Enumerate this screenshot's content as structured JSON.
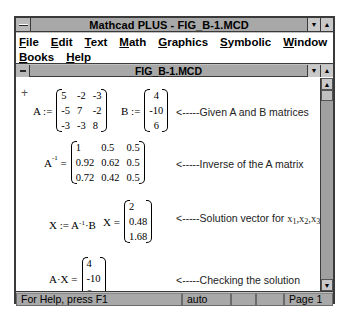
{
  "app": {
    "title": "Mathcad PLUS - FIG_B-1.MCD",
    "controls": {
      "minimize": "▼",
      "maximize": "▲"
    }
  },
  "menubar": {
    "row1": [
      {
        "key": "F",
        "rest": "ile",
        "label": "File"
      },
      {
        "key": "E",
        "rest": "dit",
        "label": "Edit"
      },
      {
        "key": "T",
        "rest": "ext",
        "label": "Text"
      },
      {
        "key": "M",
        "rest": "ath",
        "label": "Math"
      },
      {
        "key": "G",
        "rest": "raphics",
        "label": "Graphics"
      },
      {
        "key": "S",
        "rest": "ymbolic",
        "label": "Symbolic"
      },
      {
        "key": "W",
        "rest": "indow",
        "label": "Window"
      }
    ],
    "row2": [
      {
        "key": "B",
        "rest": "ooks",
        "label": "Books"
      },
      {
        "key": "H",
        "rest": "elp",
        "label": "Help"
      }
    ]
  },
  "document": {
    "title": "FIG_B-1.MCD",
    "controls": {
      "minimize": "▼",
      "maximize": "▲"
    },
    "scrollbar": {
      "up": "▲",
      "down": "▼"
    }
  },
  "worksheet": {
    "cursor": "+",
    "defA": {
      "label": "A :=",
      "matrix": [
        [
          "5",
          "-2",
          "-3"
        ],
        [
          "-5",
          "7",
          "-2"
        ],
        [
          "-3",
          "-3",
          "8"
        ]
      ]
    },
    "defB": {
      "label": "B :=",
      "matrix": [
        [
          "4"
        ],
        [
          "-10"
        ],
        [
          "6"
        ]
      ]
    },
    "note1": "<-----Given A and B matrices",
    "inverse": {
      "label_base": "A",
      "label_sup": "-1",
      "label_op": "=",
      "matrix": [
        [
          "1",
          "0.5",
          "0.5"
        ],
        [
          "0.92",
          "0.62",
          "0.5"
        ],
        [
          "0.72",
          "0.42",
          "0.5"
        ]
      ]
    },
    "note2": "<-----Inverse of the A matrix",
    "solve": {
      "lhs": "X := A",
      "sup": "-1",
      "rhs": "·B"
    },
    "solution": {
      "label": "X =",
      "matrix": [
        [
          "2"
        ],
        [
          "0.48"
        ],
        [
          "1.68"
        ]
      ]
    },
    "note3": {
      "prefix": "<-----Solution vector for ",
      "vars": [
        {
          "base": "x",
          "sub": "1",
          "sep": ","
        },
        {
          "base": "x",
          "sub": "2",
          "sep": ","
        },
        {
          "base": "x",
          "sub": "3",
          "sep": ""
        }
      ]
    },
    "check": {
      "label": "A·X =",
      "matrix": [
        [
          "4"
        ],
        [
          "-10"
        ],
        [
          "6"
        ]
      ]
    },
    "note4": "<-----Checking the solution"
  },
  "statusbar": {
    "help": "For Help, press F1",
    "mode": "auto",
    "panel3": "",
    "panel4": "",
    "page": "Page 1"
  }
}
